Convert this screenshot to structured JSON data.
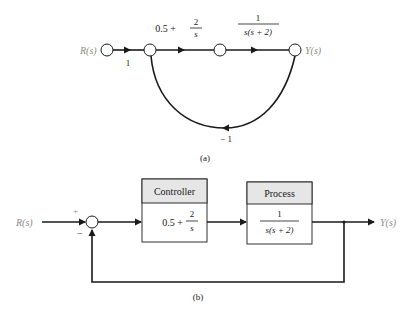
{
  "figure": {
    "panel_a": {
      "caption": "(a)",
      "type": "signal-flow-graph",
      "nodes": [
        {
          "id": "R",
          "label": "R(s)"
        },
        {
          "id": "n1",
          "label": ""
        },
        {
          "id": "n2",
          "label": ""
        },
        {
          "id": "Y",
          "label": "Y(s)"
        }
      ],
      "branches": [
        {
          "from": "R",
          "to": "n1",
          "gain": "1"
        },
        {
          "from": "n1",
          "to": "n2",
          "gain_whole": "0.5 +",
          "gain_num": "2",
          "gain_den": "s"
        },
        {
          "from": "n2",
          "to": "Y",
          "gain_num": "1",
          "gain_den": "s(s + 2)"
        },
        {
          "from": "Y",
          "to": "n1",
          "gain": "− 1"
        }
      ]
    },
    "panel_b": {
      "caption": "(b)",
      "type": "block-diagram",
      "input_label": "R(s)",
      "output_label": "Y(s)",
      "summing_junction": {
        "plus_sign": "+",
        "minus_sign": "−"
      },
      "controller": {
        "title": "Controller",
        "tf_whole": "0.5 +",
        "tf_num": "2",
        "tf_den": "s"
      },
      "process": {
        "title": "Process",
        "tf_num": "1",
        "tf_den": "s(s + 2)"
      },
      "feedback": "unity negative"
    }
  },
  "colors": {
    "line": "#1a1a1a",
    "header_fill": "#e6e6e6",
    "label_grey": "#8a8a8a"
  }
}
